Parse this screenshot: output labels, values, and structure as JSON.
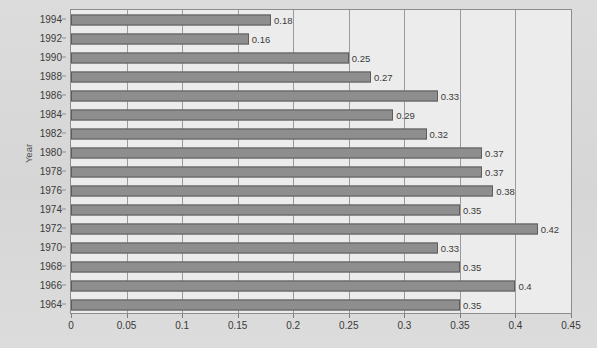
{
  "chart_data": {
    "type": "bar",
    "orientation": "horizontal",
    "title": "",
    "xlabel": "",
    "ylabel": "Year",
    "xlim": [
      0,
      0.45
    ],
    "ylim": null,
    "grid": true,
    "legend": null,
    "xticks": [
      "0",
      "0.05",
      "0.1",
      "0.15",
      "0.2",
      "0.25",
      "0.3",
      "0.35",
      "0.4",
      "0.45"
    ],
    "xtick_values": [
      0,
      0.05,
      0.1,
      0.15,
      0.2,
      0.25,
      0.3,
      0.35,
      0.4,
      0.45
    ],
    "categories": [
      "1994",
      "1992",
      "1990",
      "1988",
      "1986",
      "1984",
      "1982",
      "1980",
      "1978",
      "1976",
      "1974",
      "1972",
      "1970",
      "1968",
      "1966",
      "1964"
    ],
    "values": [
      0.18,
      0.16,
      0.25,
      0.27,
      0.33,
      0.29,
      0.32,
      0.37,
      0.37,
      0.38,
      0.35,
      0.42,
      0.33,
      0.35,
      0.4,
      0.35
    ],
    "data_labels": [
      "0.18",
      "0.16",
      "0.25",
      "0.27",
      "0.33",
      "0.29",
      "0.32",
      "0.37",
      "0.37",
      "0.38",
      "0.35",
      "0.42",
      "0.33",
      "0.35",
      "0.4",
      "0.35"
    ],
    "bars": [
      {
        "category": "1994",
        "value": 0.18,
        "label": "0.18"
      },
      {
        "category": "1992",
        "value": 0.16,
        "label": "0.16"
      },
      {
        "category": "1990",
        "value": 0.25,
        "label": "0.25"
      },
      {
        "category": "1988",
        "value": 0.27,
        "label": "0.27"
      },
      {
        "category": "1986",
        "value": 0.33,
        "label": "0.33"
      },
      {
        "category": "1984",
        "value": 0.29,
        "label": "0.29"
      },
      {
        "category": "1982",
        "value": 0.32,
        "label": "0.32"
      },
      {
        "category": "1980",
        "value": 0.37,
        "label": "0.37"
      },
      {
        "category": "1978",
        "value": 0.37,
        "label": "0.37"
      },
      {
        "category": "1976",
        "value": 0.38,
        "label": "0.38"
      },
      {
        "category": "1974",
        "value": 0.35,
        "label": "0.35"
      },
      {
        "category": "1972",
        "value": 0.42,
        "label": "0.42"
      },
      {
        "category": "1970",
        "value": 0.33,
        "label": "0.33"
      },
      {
        "category": "1968",
        "value": 0.35,
        "label": "0.35"
      },
      {
        "category": "1966",
        "value": 0.4,
        "label": "0.4"
      },
      {
        "category": "1964",
        "value": 0.35,
        "label": "0.35"
      }
    ]
  },
  "style": {
    "bar_fill": "#8e8e8e",
    "bar_stroke": "#5d5d5d",
    "plot_bg": "#ececec",
    "page_bg": "#d9d9d9",
    "grid_color": "#9a9a9a",
    "text_color": "#3a3a3a"
  }
}
